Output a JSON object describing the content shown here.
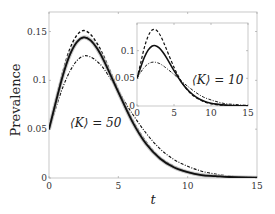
{
  "chart_data": [
    {
      "type": "line",
      "role": "main",
      "title": "",
      "xlabel": "t",
      "ylabel": "Prevalence",
      "xlim": [
        0,
        15
      ],
      "ylim": [
        0,
        0.17
      ],
      "xticks": [
        "0",
        "5",
        "10",
        "15"
      ],
      "yticks": [
        "0",
        "0.05",
        "0.1",
        "0.15"
      ],
      "annotation": "⟨K⟩ = 50",
      "x": [
        0,
        0.5,
        1,
        1.5,
        2,
        2.5,
        3,
        3.5,
        4,
        5,
        6,
        7,
        8,
        9,
        10,
        11,
        12,
        13,
        14,
        15
      ],
      "series": [
        {
          "name": "solid",
          "style": "solid",
          "values": [
            0.05,
            0.078,
            0.105,
            0.126,
            0.139,
            0.144,
            0.141,
            0.132,
            0.119,
            0.088,
            0.058,
            0.035,
            0.02,
            0.011,
            0.006,
            0.003,
            0.002,
            0.001,
            0.0005,
            0.0003
          ]
        },
        {
          "name": "dashed",
          "style": "dashed",
          "values": [
            0.05,
            0.08,
            0.109,
            0.132,
            0.146,
            0.151,
            0.147,
            0.137,
            0.123,
            0.09,
            0.06,
            0.037,
            0.021,
            0.012,
            0.006,
            0.003,
            0.002,
            0.001,
            0.0005,
            0.0003
          ]
        },
        {
          "name": "dash-dot",
          "style": "dashdot",
          "values": [
            0.05,
            0.072,
            0.093,
            0.109,
            0.12,
            0.125,
            0.124,
            0.119,
            0.111,
            0.089,
            0.066,
            0.046,
            0.03,
            0.019,
            0.012,
            0.007,
            0.004,
            0.002,
            0.001,
            0.0006
          ]
        },
        {
          "name": "gray band",
          "style": "band",
          "values": [
            0.05,
            0.078,
            0.105,
            0.126,
            0.139,
            0.144,
            0.141,
            0.132,
            0.119,
            0.088,
            0.058,
            0.035,
            0.02,
            0.011,
            0.006,
            0.003,
            0.002,
            0.001,
            0.0005,
            0.0003
          ]
        }
      ]
    },
    {
      "type": "line",
      "role": "inset",
      "xlim": [
        0,
        15
      ],
      "ylim": [
        0,
        0.15
      ],
      "xticks": [
        "0",
        "5",
        "10",
        "15"
      ],
      "yticks": [
        "0",
        "0.05",
        "0.1"
      ],
      "annotation": "⟨K⟩ = 10",
      "x": [
        0,
        0.5,
        1,
        1.5,
        2,
        2.5,
        3,
        3.5,
        4,
        5,
        6,
        7,
        8,
        9,
        10,
        11,
        12,
        13,
        14,
        15
      ],
      "series": [
        {
          "name": "solid",
          "style": "solid",
          "values": [
            0.05,
            0.07,
            0.088,
            0.101,
            0.108,
            0.109,
            0.105,
            0.097,
            0.087,
            0.064,
            0.043,
            0.027,
            0.016,
            0.009,
            0.005,
            0.003,
            0.0015,
            0.0008,
            0.0004,
            0.0002
          ]
        },
        {
          "name": "dashed",
          "style": "dashed",
          "values": [
            0.05,
            0.078,
            0.106,
            0.126,
            0.137,
            0.138,
            0.131,
            0.118,
            0.102,
            0.07,
            0.044,
            0.026,
            0.015,
            0.008,
            0.004,
            0.002,
            0.001,
            0.0005,
            0.0003,
            0.0001
          ]
        },
        {
          "name": "dash-dot",
          "style": "dashdot",
          "values": [
            0.05,
            0.061,
            0.07,
            0.076,
            0.079,
            0.079,
            0.077,
            0.073,
            0.068,
            0.057,
            0.045,
            0.034,
            0.024,
            0.016,
            0.011,
            0.007,
            0.004,
            0.003,
            0.002,
            0.001
          ]
        }
      ]
    }
  ]
}
